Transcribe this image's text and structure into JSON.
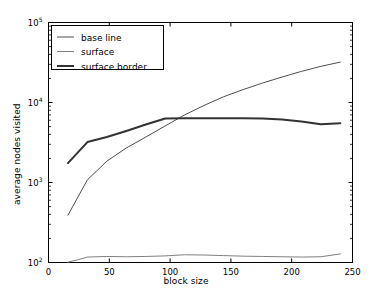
{
  "chart_data": {
    "type": "line",
    "title": "",
    "xlabel": "block size",
    "ylabel": "average nodes visited",
    "xlim": [
      0,
      250
    ],
    "ylim": [
      100,
      100000
    ],
    "yscale": "log",
    "xscale": "linear",
    "grid": false,
    "legend_position": "upper left",
    "xticks": [
      0,
      50,
      100,
      150,
      200,
      250
    ],
    "xticklabels": [
      "0",
      "50",
      "100",
      "150",
      "200",
      "250"
    ],
    "yticks": [
      100,
      1000,
      10000,
      100000
    ],
    "yticklabels": [
      "10²",
      "10³",
      "10⁴",
      "10⁵"
    ],
    "series": [
      {
        "name": "base line",
        "color": "#4d4d4d",
        "linewidth": 1,
        "x": [
          16,
          32,
          48,
          64,
          80,
          96,
          112,
          128,
          144,
          160,
          176,
          192,
          208,
          224,
          240
        ],
        "y": [
          390,
          1080,
          1850,
          2700,
          3700,
          5100,
          7000,
          9200,
          11800,
          14500,
          17500,
          20800,
          24500,
          28300,
          32000
        ]
      },
      {
        "name": "surface",
        "color": "#808080",
        "linewidth": 1,
        "x": [
          16,
          24,
          32,
          48,
          64,
          80,
          96,
          112,
          128,
          144,
          160,
          176,
          192,
          208,
          224,
          240
        ],
        "y": [
          101,
          108,
          117,
          119,
          118,
          119,
          121,
          125,
          124,
          122,
          120,
          119,
          118,
          117,
          118,
          128
        ]
      },
      {
        "name": "surface border",
        "color": "#333333",
        "linewidth": 2,
        "x": [
          16,
          32,
          48,
          64,
          80,
          96,
          112,
          128,
          144,
          160,
          176,
          192,
          208,
          224,
          240
        ],
        "y": [
          1750,
          3200,
          3700,
          4400,
          5300,
          6300,
          6350,
          6350,
          6350,
          6350,
          6300,
          6150,
          5800,
          5350,
          5500
        ]
      }
    ]
  },
  "legend": {
    "items": [
      {
        "label": "base line"
      },
      {
        "label": "surface"
      },
      {
        "label": "surface border"
      }
    ]
  }
}
